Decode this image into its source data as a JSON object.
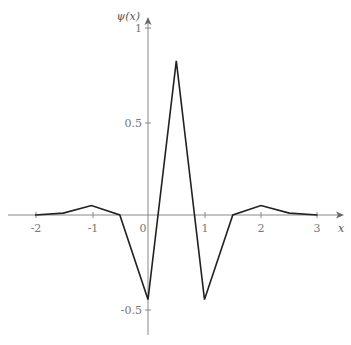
{
  "chart_data": {
    "type": "line",
    "title": "",
    "xlabel": "x",
    "ylabel": "ψ(x)",
    "xlim": [
      -2.2,
      3.4
    ],
    "ylim": [
      -0.6,
      1.0
    ],
    "grid": false,
    "legend": null,
    "x_ticks": [
      "-2",
      "-1",
      "0",
      "1",
      "2",
      "3"
    ],
    "y_ticks": [
      "1",
      "0.5",
      "-0.5"
    ],
    "series": [
      {
        "name": "ψ(x)",
        "x": [
          -2,
          -1.5,
          -1,
          -0.5,
          0,
          0.5,
          1,
          1.5,
          2,
          2.5,
          3
        ],
        "values": [
          0.0,
          0.01,
          0.05,
          0.0,
          -0.45,
          0.82,
          -0.45,
          0.0,
          0.05,
          0.01,
          0.0
        ]
      }
    ],
    "colors": {
      "curve": "#222222",
      "axis": "#888888",
      "text": "#777777"
    }
  }
}
